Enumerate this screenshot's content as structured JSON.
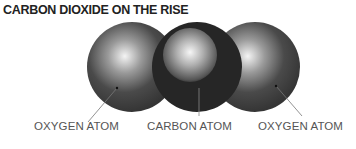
{
  "title": "CARBON DIOXIDE ON THE RISE",
  "molecule": {
    "atoms": [
      {
        "name": "oxygen-left",
        "label": "OXYGEN ATOM"
      },
      {
        "name": "carbon",
        "label": "CARBON ATOM"
      },
      {
        "name": "oxygen-right",
        "label": "OXYGEN ATOM"
      }
    ]
  },
  "colors": {
    "oxygen_dark": "#3a3a3a",
    "carbon_dark": "#262626",
    "highlight": "#f2f2f2",
    "text": "#555555",
    "title": "#222222"
  }
}
